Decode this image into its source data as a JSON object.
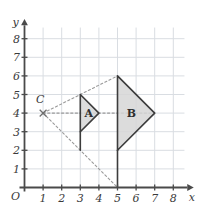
{
  "figure": {
    "background_color": "#ffffff",
    "grid_color": "#d9dde2",
    "axis_color": "#4a4a4a",
    "shape_fill": "#d6d6d6",
    "shape_stroke": "#3c3c3c",
    "dashed_color": "#9a9a9a"
  },
  "axes": {
    "x_axis_label": "x",
    "y_axis_label": "y",
    "origin_label": "O",
    "x_ticks": [
      "1",
      "2",
      "3",
      "4",
      "5",
      "6",
      "7",
      "8"
    ],
    "y_ticks": [
      "1",
      "2",
      "3",
      "4",
      "5",
      "6",
      "7",
      "8"
    ],
    "x_range": [
      0,
      8
    ],
    "y_range": [
      0,
      8
    ],
    "grid": "on"
  },
  "shapes": [
    {
      "label": "A",
      "label_point": [
        3.45,
        4.0
      ],
      "vertices": [
        [
          3,
          5
        ],
        [
          3,
          3
        ],
        [
          4,
          4
        ]
      ]
    },
    {
      "label": "B",
      "label_point": [
        5.75,
        4.0
      ],
      "vertices": [
        [
          5,
          6
        ],
        [
          5,
          2
        ],
        [
          7,
          4
        ]
      ]
    }
  ],
  "points": [
    {
      "label": "C",
      "coords": [
        1,
        4
      ],
      "marker": "cross-marker",
      "label_offset": [
        -0.15,
        0.55
      ]
    }
  ],
  "construction_rays": [
    {
      "name": "ray-c-to-top",
      "from": [
        1,
        4
      ],
      "to": [
        5,
        6
      ]
    },
    {
      "name": "ray-c-to-bottom",
      "from": [
        1,
        4
      ],
      "to": [
        5,
        0
      ]
    },
    {
      "name": "ray-c-to-apex",
      "from": [
        1,
        4
      ],
      "to": [
        7,
        4
      ]
    }
  ],
  "extension_segments": [
    {
      "name": "segment-a-left-extended",
      "from": [
        3,
        3
      ],
      "to": [
        3,
        2
      ]
    },
    {
      "name": "segment-b-left-extended",
      "from": [
        5,
        2
      ],
      "to": [
        5,
        0
      ]
    }
  ]
}
